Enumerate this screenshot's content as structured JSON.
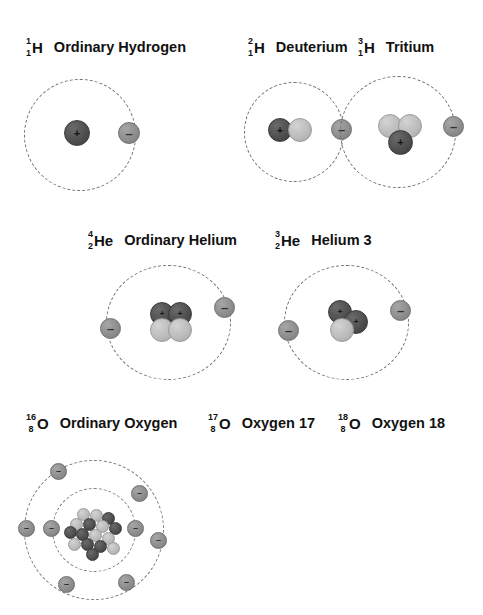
{
  "figure": {
    "title_text": "",
    "background": "#ffffff",
    "colors": {
      "proton": "#4d4d4d",
      "neutron": "#b9b9b9",
      "electron": "#8b8b8b",
      "orbit": "#6f6f6f",
      "text": "#111111"
    },
    "symbols": {
      "proton_sign": "+",
      "electron_sign": "–",
      "neutron_sign": ""
    }
  },
  "isotopes": [
    {
      "id": "hydrogen-1",
      "mass_number": "1",
      "atomic_number": "1",
      "element_symbol": "H",
      "name": "Ordinary Hydrogen",
      "protons": 1,
      "neutrons": 0,
      "electrons": 1,
      "shells": [
        1
      ]
    },
    {
      "id": "hydrogen-2",
      "mass_number": "2",
      "atomic_number": "1",
      "element_symbol": "H",
      "name": "Deuterium",
      "protons": 1,
      "neutrons": 1,
      "electrons": 1,
      "shells": [
        1
      ]
    },
    {
      "id": "hydrogen-3",
      "mass_number": "3",
      "atomic_number": "1",
      "element_symbol": "H",
      "name": "Tritium",
      "protons": 1,
      "neutrons": 2,
      "electrons": 1,
      "shells": [
        1
      ]
    },
    {
      "id": "helium-4",
      "mass_number": "4",
      "atomic_number": "2",
      "element_symbol": "He",
      "name": "Ordinary Helium",
      "protons": 2,
      "neutrons": 2,
      "electrons": 2,
      "shells": [
        2
      ]
    },
    {
      "id": "helium-3",
      "mass_number": "3",
      "atomic_number": "2",
      "element_symbol": "He",
      "name": "Helium 3",
      "protons": 2,
      "neutrons": 1,
      "electrons": 2,
      "shells": [
        2
      ]
    },
    {
      "id": "oxygen-16",
      "mass_number": "16",
      "atomic_number": "8",
      "element_symbol": "O",
      "name": "Ordinary Oxygen",
      "protons": 8,
      "neutrons": 8,
      "electrons": 8,
      "shells": [
        2,
        6
      ]
    },
    {
      "id": "oxygen-17",
      "mass_number": "17",
      "atomic_number": "8",
      "element_symbol": "O",
      "name": "Oxygen 17",
      "protons": 8,
      "neutrons": 9,
      "electrons": 8,
      "shells": [
        2,
        6
      ]
    },
    {
      "id": "oxygen-18",
      "mass_number": "18",
      "atomic_number": "8",
      "element_symbol": "O",
      "name": "Oxygen 18",
      "protons": 8,
      "neutrons": 10,
      "electrons": 8,
      "shells": [
        2,
        6
      ]
    }
  ]
}
